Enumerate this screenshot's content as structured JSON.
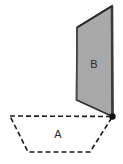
{
  "figure": {
    "background_color": "#ffffff",
    "shared_vertex": {
      "name": "shared-vertex-point",
      "x": 112.5,
      "y": 116.5,
      "radius": 3.2,
      "color": "#111111"
    },
    "regions": [
      {
        "id": "region-a",
        "label": "A",
        "shape": "trapezoid",
        "style": "dashed-outline",
        "fill": "none",
        "stroke": "#1a1a1a",
        "stroke_width": 1.6,
        "dash_pattern": "5,3",
        "points": "10,116 112.5,116.5 90,152 28,152",
        "label_x": 58,
        "label_y": 135
      },
      {
        "id": "region-b",
        "label": "B",
        "shape": "parallelogram",
        "style": "solid-filled",
        "fill": "#a8a8a8",
        "stroke": "#2a2a2a",
        "stroke_width": 1.6,
        "edge_highlight_color": "#3a3a3a",
        "edge_highlight_width": 2.6,
        "points": "77,27.5 112,6 112.5,116.5 76.5,100",
        "label_x": 94,
        "label_y": 65
      }
    ]
  }
}
